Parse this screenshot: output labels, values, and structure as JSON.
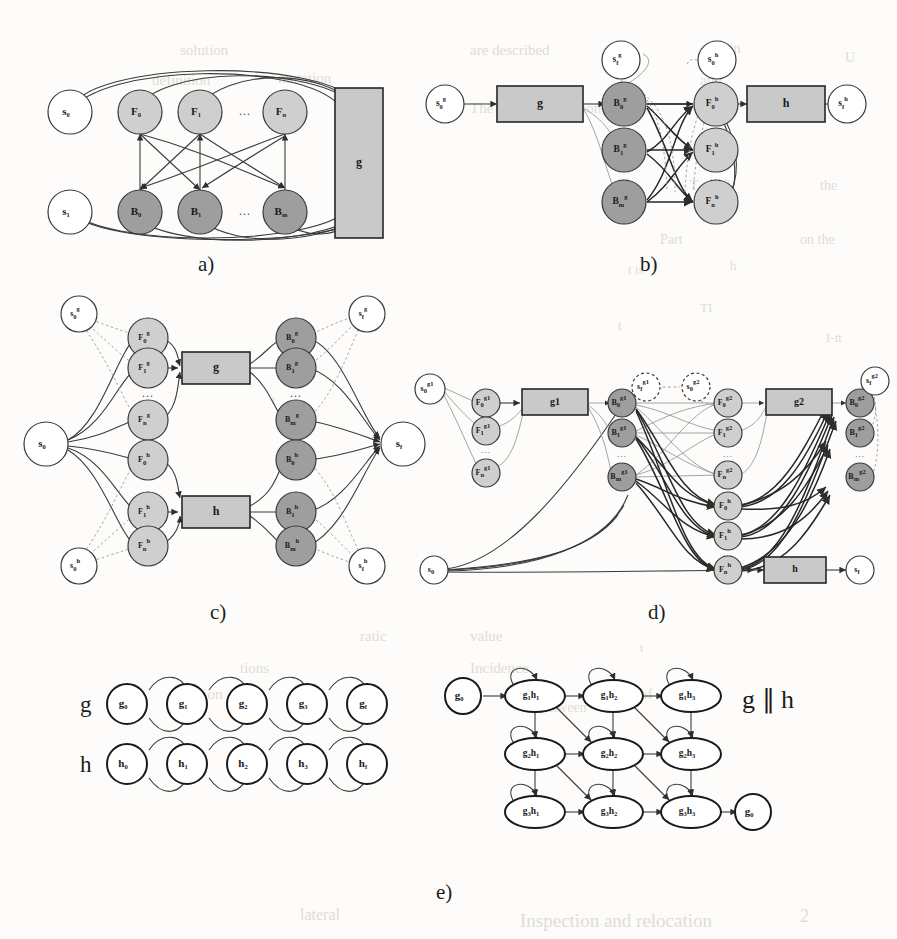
{
  "figure": {
    "caption_labels": [
      "a)",
      "b)",
      "c)",
      "d)",
      "e)"
    ],
    "background_color": "#fdfcfa",
    "node_colors": {
      "plain": "#ffffff",
      "forward_light": "#cfcfcf",
      "backward_dark": "#9e9e9e",
      "box_gray": "#c9c9c9"
    }
  },
  "panel_a": {
    "label": "a)",
    "start_node": "s0",
    "end_node": "s1",
    "forward_nodes": [
      "F0",
      "F1",
      "Fn"
    ],
    "backward_nodes": [
      "B0",
      "B1",
      "Bm"
    ],
    "ellipsis": "...",
    "box_label": "g"
  },
  "panel_b": {
    "label": "b)",
    "left_state": "s0",
    "left_state_sup": "g",
    "top_state_left": "sf",
    "top_state_left_sup": "g",
    "top_state_right": "s0",
    "top_state_right_sup": "h",
    "right_state": "sf",
    "right_state_sup": "h",
    "box_left": "g",
    "box_right": "h",
    "backward_nodes": [
      {
        "base": "B",
        "sub": "0",
        "sup": "g"
      },
      {
        "base": "B",
        "sub": "1",
        "sup": "g"
      },
      {
        "base": "B",
        "sub": "m",
        "sup": "g"
      }
    ],
    "forward_nodes": [
      {
        "base": "F",
        "sub": "0",
        "sup": "h"
      },
      {
        "base": "F",
        "sub": "1",
        "sup": "h"
      },
      {
        "base": "F",
        "sub": "n",
        "sup": "h"
      }
    ],
    "ellipsis": "..."
  },
  "panel_c": {
    "label": "c)",
    "start_node": "s0",
    "end_node": "sf",
    "corner_states": [
      {
        "base": "s",
        "sub": "0",
        "sup": "g"
      },
      {
        "base": "s",
        "sub": "f",
        "sup": "g"
      },
      {
        "base": "s",
        "sub": "0",
        "sup": "h"
      },
      {
        "base": "s",
        "sub": "f",
        "sup": "h"
      }
    ],
    "forward_nodes": [
      {
        "base": "F",
        "sub": "0",
        "sup": "g"
      },
      {
        "base": "F",
        "sub": "1",
        "sup": "g"
      },
      {
        "base": "F",
        "sub": "n",
        "sup": "g"
      },
      {
        "base": "F",
        "sub": "0",
        "sup": "h"
      },
      {
        "base": "F",
        "sub": "1",
        "sup": "h"
      },
      {
        "base": "F",
        "sub": "n",
        "sup": "h"
      }
    ],
    "backward_nodes": [
      {
        "base": "B",
        "sub": "0",
        "sup": "g"
      },
      {
        "base": "B",
        "sub": "1",
        "sup": "g"
      },
      {
        "base": "B",
        "sub": "m",
        "sup": "g"
      },
      {
        "base": "B",
        "sub": "0",
        "sup": "h"
      },
      {
        "base": "B",
        "sub": "1",
        "sup": "h"
      },
      {
        "base": "B",
        "sub": "m",
        "sup": "h"
      }
    ],
    "box_top": "g",
    "box_bottom": "h",
    "ellipsis": "..."
  },
  "panel_d": {
    "label": "d)",
    "start_node": "s0",
    "bottom_start_node": "s0",
    "end_node": "sf",
    "box_left": "g1",
    "box_right": "g2",
    "box_bottom": "h",
    "right_end_node": "sf",
    "col1_forward": [
      {
        "base": "F",
        "sub": "0",
        "sup": "g1"
      },
      {
        "base": "F",
        "sub": "1",
        "sup": "g1"
      },
      {
        "base": "F",
        "sub": "n",
        "sup": "g1"
      }
    ],
    "col2_backward": [
      {
        "base": "B",
        "sub": "0",
        "sup": "g1"
      },
      {
        "base": "B",
        "sub": "1",
        "sup": "g1"
      },
      {
        "base": "B",
        "sub": "m",
        "sup": "g1"
      }
    ],
    "dashed_states": [
      {
        "base": "s",
        "sub": "f",
        "sup": "g1"
      },
      {
        "base": "s",
        "sub": "0",
        "sup": "g2"
      }
    ],
    "col3_forward": [
      {
        "base": "F",
        "sub": "0",
        "sup": "g2"
      },
      {
        "base": "F",
        "sub": "1",
        "sup": "g2"
      },
      {
        "base": "F",
        "sub": "n",
        "sup": "g2"
      },
      {
        "base": "F",
        "sub": "0",
        "sup": "h"
      },
      {
        "base": "F",
        "sub": "1",
        "sup": "h"
      },
      {
        "base": "F",
        "sub": "n",
        "sup": "h"
      }
    ],
    "col4_backward": [
      {
        "base": "B",
        "sub": "0",
        "sup": "g2"
      },
      {
        "base": "B",
        "sub": "1",
        "sup": "g2"
      },
      {
        "base": "B",
        "sub": "m",
        "sup": "g2"
      }
    ],
    "ellipsis": "..."
  },
  "panel_e": {
    "label": "e)",
    "row_label_g": "g",
    "row_label_h": "h",
    "chain_g": [
      {
        "base": "g",
        "sub": "0"
      },
      {
        "base": "g",
        "sub": "1"
      },
      {
        "base": "g",
        "sub": "2"
      },
      {
        "base": "g",
        "sub": "3"
      },
      {
        "base": "g",
        "sub": "f"
      }
    ],
    "chain_h": [
      {
        "base": "h",
        "sub": "0"
      },
      {
        "base": "h",
        "sub": "1"
      },
      {
        "base": "h",
        "sub": "2"
      },
      {
        "base": "h",
        "sub": "3"
      },
      {
        "base": "h",
        "sub": "f"
      }
    ],
    "product_title": "g ∥ h",
    "product_entry": {
      "base": "g",
      "sub": "0"
    },
    "product_exit": {
      "base": "g",
      "sub": "0"
    },
    "product_grid": [
      [
        {
          "g": "g",
          "gs": "1",
          "h": "h",
          "hs": "1"
        },
        {
          "g": "g",
          "gs": "1",
          "h": "h",
          "hs": "2"
        },
        {
          "g": "g",
          "gs": "1",
          "h": "h",
          "hs": "3"
        }
      ],
      [
        {
          "g": "g",
          "gs": "2",
          "h": "h",
          "hs": "1"
        },
        {
          "g": "g",
          "gs": "2",
          "h": "h",
          "hs": "2"
        },
        {
          "g": "g",
          "gs": "2",
          "h": "h",
          "hs": "3"
        }
      ],
      [
        {
          "g": "g",
          "gs": "3",
          "h": "h",
          "hs": "1"
        },
        {
          "g": "g",
          "gs": "3",
          "h": "h",
          "hs": "2"
        },
        {
          "g": "g",
          "gs": "3",
          "h": "h",
          "hs": "3"
        }
      ]
    ]
  },
  "bleedthrough": {
    "lines": [
      {
        "text": "solution",
        "x": 180,
        "y": 42,
        "size": 15
      },
      {
        "text": "are described",
        "x": 470,
        "y": 42,
        "size": 15
      },
      {
        "text": "can",
        "x": 720,
        "y": 40,
        "size": 15
      },
      {
        "text": "U",
        "x": 845,
        "y": 50,
        "size": 14
      },
      {
        "text": "definition",
        "x": 152,
        "y": 72,
        "size": 15
      },
      {
        "text": "mutation",
        "x": 278,
        "y": 70,
        "size": 15
      },
      {
        "text": "and",
        "x": 700,
        "y": 72,
        "size": 15
      },
      {
        "text": "The result for relation",
        "x": 470,
        "y": 100,
        "size": 15
      },
      {
        "text": "VI",
        "x": 838,
        "y": 108,
        "size": 14
      },
      {
        "text": "the",
        "x": 700,
        "y": 140,
        "size": 15
      },
      {
        "text": "III",
        "x": 612,
        "y": 152,
        "size": 14
      },
      {
        "text": "T + 1 2",
        "x": 690,
        "y": 178,
        "size": 14
      },
      {
        "text": "the",
        "x": 820,
        "y": 178,
        "size": 14
      },
      {
        "text": "with",
        "x": 616,
        "y": 205,
        "size": 14
      },
      {
        "text": "Part",
        "x": 660,
        "y": 232,
        "size": 14
      },
      {
        "text": "on the",
        "x": 800,
        "y": 232,
        "size": 14
      },
      {
        "text": "t is",
        "x": 628,
        "y": 262,
        "size": 13
      },
      {
        "text": "h",
        "x": 730,
        "y": 258,
        "size": 13
      },
      {
        "text": "I-tt",
        "x": 826,
        "y": 330,
        "size": 13
      },
      {
        "text": "t",
        "x": 618,
        "y": 318,
        "size": 13
      },
      {
        "text": "TI",
        "x": 700,
        "y": 300,
        "size": 13
      },
      {
        "text": "lh",
        "x": 860,
        "y": 380,
        "size": 13
      },
      {
        "text": "t",
        "x": 272,
        "y": 392,
        "size": 13
      },
      {
        "text": "t",
        "x": 640,
        "y": 640,
        "size": 13
      },
      {
        "text": "ratic",
        "x": 360,
        "y": 628,
        "size": 15
      },
      {
        "text": "value",
        "x": 470,
        "y": 628,
        "size": 15
      },
      {
        "text": "tions",
        "x": 240,
        "y": 660,
        "size": 15
      },
      {
        "text": "Incidence",
        "x": 470,
        "y": 660,
        "size": 15
      },
      {
        "text": "of",
        "x": 640,
        "y": 686,
        "size": 15
      },
      {
        "text": "olution",
        "x": 180,
        "y": 686,
        "size": 15
      },
      {
        "text": "between",
        "x": 540,
        "y": 700,
        "size": 14
      },
      {
        "text": "lateral",
        "x": 300,
        "y": 906,
        "size": 16
      },
      {
        "text": "Inspection and relocation",
        "x": 520,
        "y": 910,
        "size": 19
      },
      {
        "text": "2",
        "x": 800,
        "y": 906,
        "size": 18
      }
    ]
  }
}
